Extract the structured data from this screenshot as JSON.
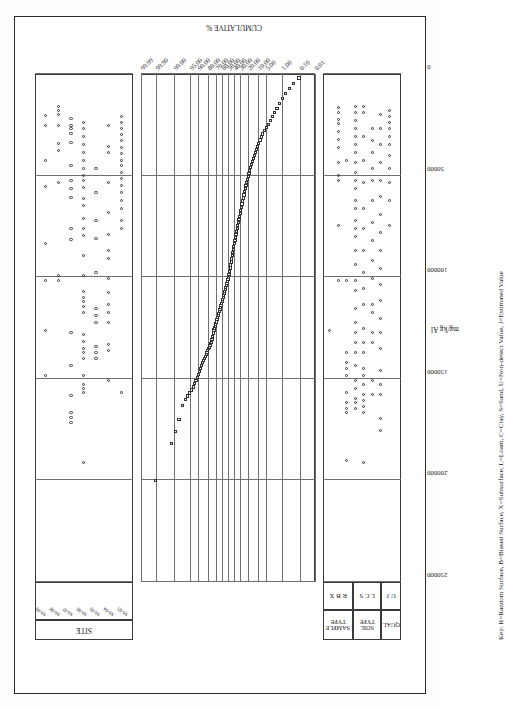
{
  "figure": {
    "orientation": "rotated-90-landscape",
    "key_text": "Key: R=Random Surface, B=Biased Surface, X=Subsurface, L=Loam, C=Clay, S=Sand, U=Non-detect Value, J=Estimated Value"
  },
  "panels": {
    "site": {
      "title": "SITE"
    },
    "sample_type": {
      "title": "SAMPLE TYPE",
      "codes": "R B X"
    },
    "soil_type": {
      "title": "SOIL TYPE",
      "codes": "L C S"
    },
    "qual": {
      "title": "QUAL",
      "codes": "U J"
    }
  },
  "axes": {
    "concentration": {
      "title": "mg/kg Al",
      "ticks": [
        "250000",
        "200000",
        "150000",
        "100000",
        "50000",
        "0"
      ],
      "values": [
        250000,
        200000,
        150000,
        100000,
        50000,
        0
      ],
      "min": 0,
      "max": 250000
    },
    "cumulative": {
      "title": "CUMULATIVE %",
      "ticks": [
        "99.99",
        "99.90",
        "99.00",
        "95.00",
        "90.00",
        "80.00",
        "70.00",
        "60.00",
        "50.00",
        "40.00",
        "30.00",
        "20.00",
        "10.00",
        "5.00",
        "1.00",
        "0.10",
        "0.01"
      ],
      "values": [
        99.99,
        99.9,
        99.0,
        95.0,
        90.0,
        80.0,
        70.0,
        60.0,
        50.0,
        40.0,
        30.0,
        20.0,
        10.0,
        5.0,
        1.0,
        0.1,
        0.01
      ]
    }
  },
  "site_codes": [
    "SS-09",
    "SS-08",
    "SS-07",
    "SS-06",
    "SS-05",
    "SS-04",
    "SS-03"
  ],
  "chart_data": {
    "type": "scatter",
    "title": "",
    "subtitle": "",
    "xlabel": "CUMULATIVE %",
    "ylabel": "mg/kg Al",
    "grid": true,
    "legend_position": "none",
    "xlim": [
      0.01,
      99.99
    ],
    "ylim": [
      0,
      250000
    ],
    "x_scale": "probability",
    "note": "Probability (normal-score) plot of aluminum concentration. x = cumulative percent, y = mg/kg Al. Open-square markers.",
    "series": [
      {
        "name": "Al concentration",
        "marker": "open-square",
        "x": [
          99.9,
          99.2,
          98.8,
          98.2,
          97.4,
          96.6,
          95.8,
          95.0,
          94.1,
          93.2,
          92.3,
          91.4,
          90.5,
          89.6,
          88.7,
          87.8,
          86.9,
          86.0,
          85.1,
          84.2,
          83.3,
          82.4,
          81.5,
          80.6,
          79.7,
          78.8,
          77.9,
          77.0,
          76.1,
          75.2,
          74.3,
          73.4,
          72.5,
          71.6,
          70.7,
          69.8,
          68.9,
          68.0,
          67.1,
          66.2,
          65.3,
          64.4,
          63.5,
          62.6,
          61.7,
          60.8,
          59.9,
          59.0,
          58.1,
          57.2,
          56.3,
          55.4,
          54.5,
          53.6,
          52.7,
          51.8,
          50.9,
          50.0,
          49.1,
          48.2,
          47.3,
          46.4,
          45.5,
          44.6,
          43.7,
          42.8,
          41.9,
          41.0,
          40.1,
          39.2,
          38.3,
          37.4,
          36.5,
          35.6,
          34.7,
          33.8,
          32.9,
          32.0,
          31.1,
          30.2,
          29.3,
          28.4,
          27.5,
          26.6,
          25.7,
          24.8,
          23.9,
          23.0,
          22.1,
          21.2,
          20.3,
          19.4,
          18.5,
          17.6,
          16.7,
          15.8,
          14.9,
          14.0,
          13.1,
          12.2,
          11.3,
          10.4,
          9.5,
          8.6,
          7.7,
          6.8,
          5.9,
          5.0,
          4.2,
          3.5,
          2.9,
          2.3,
          1.8,
          1.4,
          1.0,
          0.7,
          0.45,
          0.25,
          0.12
        ],
        "y": [
          200000,
          182000,
          176000,
          170000,
          163000,
          160000,
          158500,
          157000,
          155500,
          154000,
          152500,
          151000,
          149500,
          148000,
          146500,
          145000,
          143500,
          142000,
          141000,
          140000,
          139000,
          138000,
          137000,
          136000,
          135200,
          134400,
          133600,
          132800,
          132000,
          130500,
          129000,
          127500,
          126000,
          125000,
          124000,
          123000,
          122000,
          121000,
          120000,
          119000,
          118000,
          117000,
          116000,
          115000,
          114000,
          113000,
          112000,
          111000,
          110000,
          109000,
          108000,
          107000,
          106000,
          105000,
          104000,
          103000,
          102000,
          101000,
          100000,
          98500,
          97000,
          95500,
          94000,
          92500,
          91000,
          89500,
          88000,
          86500,
          85000,
          83500,
          82000,
          80500,
          79000,
          77500,
          76000,
          74500,
          73000,
          71500,
          70000,
          68500,
          67000,
          65500,
          64000,
          62500,
          61000,
          59500,
          58000,
          56500,
          55000,
          53500,
          52000,
          50500,
          49000,
          47500,
          46000,
          44500,
          43000,
          41500,
          40000,
          38500,
          37000,
          35500,
          34000,
          32500,
          31000,
          29500,
          28000,
          26500,
          25000,
          23000,
          21000,
          19000,
          17000,
          14500,
          12000,
          9500,
          7000,
          4500,
          2000
        ]
      }
    ],
    "site_panel": {
      "description": "Categorical strip plot of sample counts by SITE, sharing the mg/kg Al axis",
      "rows": 7,
      "marker": "open-circle"
    },
    "attribute_panel": {
      "description": "Categorical strip plot of SAMPLE TYPE (R,B,X), SOIL TYPE (L,C,S) and QUAL (U,J) rows, sharing the mg/kg Al axis",
      "rows": [
        "R",
        "B",
        "X",
        "L",
        "C",
        "S",
        "U",
        "J"
      ],
      "marker": "open-circle"
    }
  }
}
